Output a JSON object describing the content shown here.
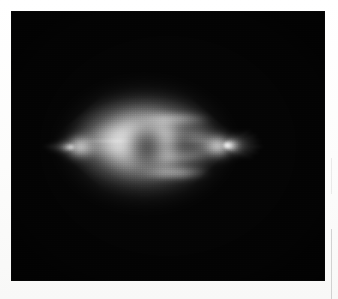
{
  "page": {
    "background_color": "#fdfdfc",
    "width": 338,
    "height": 299
  },
  "scan_artifacts": {
    "rule_upper_label": "",
    "rule_lower_label": ""
  },
  "micrograph": {
    "caption": "",
    "background_color": "#030303",
    "frame": {
      "left": 11,
      "top": 11,
      "width": 314,
      "height": 270
    },
    "modality": "fluorescence micrograph",
    "subject": "mitotic spindle",
    "description": "Bright lens/diamond-shaped bipolar spindle with two opposed poles, radiating astral rays and dark chromatin mass at the equator, imaged against a black field.",
    "structures": [
      {
        "name": "spindle-halo",
        "label": ""
      },
      {
        "name": "spindle-body-upper",
        "label": ""
      },
      {
        "name": "spindle-body-lower",
        "label": ""
      },
      {
        "name": "equatorial-band",
        "label": ""
      },
      {
        "name": "chromatin-shadow",
        "label": ""
      },
      {
        "name": "pole-left",
        "label": ""
      },
      {
        "name": "pole-right",
        "label": ""
      }
    ],
    "palette": {
      "field": "#040404",
      "highlight": "#ececec",
      "midtone": "#9a9a9a",
      "shadow": "#2a2a2a"
    },
    "astral_rays_left": [
      {
        "angle": 172,
        "length": 26,
        "width": 2.4,
        "opacity": 0.7
      },
      {
        "angle": 182,
        "length": 30,
        "width": 2.8,
        "opacity": 0.78
      },
      {
        "angle": 192,
        "length": 24,
        "width": 2.2,
        "opacity": 0.62
      },
      {
        "angle": 160,
        "length": 20,
        "width": 2.0,
        "opacity": 0.5
      },
      {
        "angle": 202,
        "length": 19,
        "width": 2.0,
        "opacity": 0.48
      },
      {
        "angle": 150,
        "length": 15,
        "width": 1.8,
        "opacity": 0.38
      },
      {
        "angle": 212,
        "length": 15,
        "width": 1.8,
        "opacity": 0.36
      }
    ],
    "astral_rays_right": [
      {
        "angle": -30,
        "length": 30,
        "width": 2.6,
        "opacity": 0.72
      },
      {
        "angle": -18,
        "length": 34,
        "width": 2.8,
        "opacity": 0.8
      },
      {
        "angle": -8,
        "length": 36,
        "width": 3.0,
        "opacity": 0.86
      },
      {
        "angle": 2,
        "length": 38,
        "width": 3.0,
        "opacity": 0.88
      },
      {
        "angle": 12,
        "length": 35,
        "width": 2.8,
        "opacity": 0.82
      },
      {
        "angle": 23,
        "length": 31,
        "width": 2.6,
        "opacity": 0.74
      },
      {
        "angle": 34,
        "length": 26,
        "width": 2.3,
        "opacity": 0.62
      },
      {
        "angle": 45,
        "length": 21,
        "width": 2.0,
        "opacity": 0.5
      },
      {
        "angle": -42,
        "length": 23,
        "width": 2.2,
        "opacity": 0.56
      },
      {
        "angle": -54,
        "length": 17,
        "width": 1.9,
        "opacity": 0.42
      }
    ]
  },
  "chart_data": {
    "type": "heatmap",
    "title": "",
    "xlabel": "",
    "ylabel": "",
    "intensity_range": [
      0,
      255
    ],
    "colormap": "grayscale",
    "grid": false,
    "legend": "none",
    "features": [
      {
        "name": "left pole",
        "x": 62,
        "y": 136,
        "intensity": 235
      },
      {
        "name": "right pole",
        "x": 216,
        "y": 134,
        "intensity": 242
      },
      {
        "name": "equator center",
        "x": 139,
        "y": 131,
        "intensity": 150
      },
      {
        "name": "chromatin mass",
        "x": 136,
        "y": 136,
        "intensity": 95
      },
      {
        "name": "upper cone apex",
        "x": 140,
        "y": 62,
        "intensity": 70
      },
      {
        "name": "lower cone apex",
        "x": 140,
        "y": 214,
        "intensity": 60
      },
      {
        "name": "background field",
        "x": 30,
        "y": 30,
        "intensity": 4
      }
    ]
  }
}
